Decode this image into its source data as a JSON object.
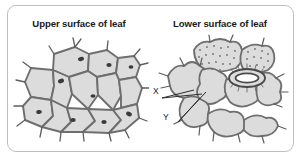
{
  "figure": {
    "background_color": "#ffffff",
    "border_color": "#bfbfbf"
  },
  "panels": [
    {
      "id": "upper",
      "title": "Upper surface of leaf",
      "diagram_name": "upper-epidermis-cells-diagram",
      "description": "Interlocking polygonal epidermal cells with thick walls, small dark nuclei and short spine-like hairs on the outer margins. No stomata visible.",
      "cell_fill": "#dcdcdc",
      "wall_color": "#6e6e6e",
      "nucleus_color": "#3a3a3a"
    },
    {
      "id": "lower",
      "title": "Lower surface of leaf",
      "diagram_name": "lower-epidermis-cells-diagram",
      "description": "Wavy lobed epidermal cells with a stoma formed by two kidney-shaped guard cells, plus stippled cells above and spine-like hairs.",
      "cell_fill": "#dcdcdc",
      "wall_color": "#6e6e6e",
      "stipple_color": "#707070",
      "labels": [
        {
          "text": "X",
          "target": "guard-cell"
        },
        {
          "text": "Y",
          "target": "stomatal-pore"
        }
      ]
    }
  ]
}
